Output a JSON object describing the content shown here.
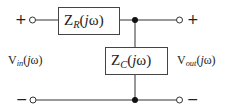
{
  "diagram": {
    "type": "circuit-schematic",
    "components": {
      "series_impedance": {
        "symbol": "Z",
        "subscript": "R",
        "argument": "(jω)",
        "arg_open": "(",
        "arg_j": "j",
        "arg_rest": "ω)"
      },
      "shunt_impedance": {
        "symbol": "Z",
        "subscript": "C",
        "argument": "(jω)",
        "arg_open": "(",
        "arg_j": "j",
        "arg_rest": "ω)"
      }
    },
    "ports": {
      "input": {
        "symbol": "V",
        "subscript": "in",
        "argument": "(jω)",
        "arg_open": "(",
        "arg_j": "j",
        "arg_rest": "ω)",
        "plus": "+",
        "minus": "−"
      },
      "output": {
        "symbol": "V",
        "subscript": "out",
        "argument": "(jω)",
        "arg_open": "(",
        "arg_j": "j",
        "arg_rest": "ω)",
        "plus": "+",
        "minus": "−"
      }
    },
    "colors": {
      "stroke": "#333333",
      "fill_node": "#111111",
      "background": "#ffffff"
    }
  }
}
